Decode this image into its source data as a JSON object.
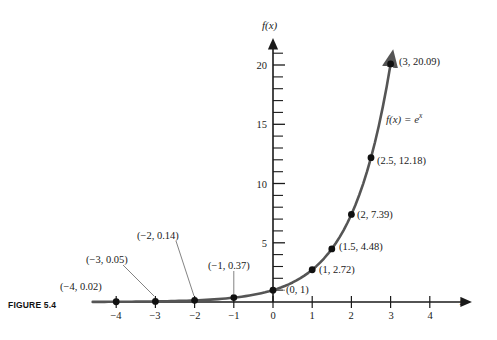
{
  "figure": {
    "caption": "FIGURE 5.4",
    "equation_label_fx": "f(x) = e",
    "equation_label_exp": "x"
  },
  "axes": {
    "x_axis_name": "x",
    "y_axis_name": "f(x)",
    "x_tick_labels": [
      "−4",
      "−3",
      "−2",
      "−1",
      "0",
      "1",
      "2",
      "3",
      "4"
    ],
    "y_tick_labels": [
      "5",
      "10",
      "15",
      "20"
    ]
  },
  "point_labels": [
    "(−4, 0.02)",
    "(−3, 0.05)",
    "(−2, 0.14)",
    "(−1, 0.37)",
    "(0, 1)",
    "(1, 2.72)",
    "(1.5, 4.48)",
    "(2, 7.39)",
    "(2.5, 12.18)",
    "(3, 20.09)"
  ],
  "colors": {
    "axis": "#1a1a1a",
    "curve": "#555555",
    "point": "#111111",
    "leader": "#6a6a6a",
    "text": "#1a1a1a"
  },
  "chart_data": {
    "type": "line",
    "title": "FIGURE 5.4",
    "subtitle": "",
    "function": "f(x) = e^x",
    "xlabel": "x",
    "ylabel": "f(x)",
    "xlim": [
      -4.6,
      4.9
    ],
    "ylim": [
      -0.9,
      21.6
    ],
    "x_ticks": [
      -4,
      -3,
      -2,
      -1,
      0,
      1,
      2,
      3,
      4
    ],
    "y_ticks": [
      5,
      10,
      15,
      20
    ],
    "y_minor_ticks": [
      1,
      2,
      3,
      4,
      6,
      7,
      8,
      9,
      11,
      12,
      13,
      14,
      16,
      17,
      18,
      19,
      21
    ],
    "grid": false,
    "legend": "none",
    "annotation": "f(x) = e^x",
    "series": [
      {
        "name": "f(x) = e^x",
        "x": [
          -4,
          -3,
          -2,
          -1,
          0,
          1,
          1.5,
          2,
          2.5,
          3
        ],
        "values": [
          0.02,
          0.05,
          0.14,
          0.37,
          1,
          2.72,
          4.48,
          7.39,
          12.18,
          20.09
        ],
        "labels": [
          "(−4, 0.02)",
          "(−3, 0.05)",
          "(−2, 0.14)",
          "(−1, 0.37)",
          "(0, 1)",
          "(1, 2.72)",
          "(1.5, 4.48)",
          "(2, 7.39)",
          "(2.5, 12.18)",
          "(3, 20.09)"
        ]
      }
    ]
  },
  "geometry": {
    "origin_x": 273,
    "origin_y": 302,
    "unit_x": 39.2,
    "unit_y": 11.85,
    "label_positions": [
      {
        "key": "n4",
        "text_x": 60,
        "text_y": 281,
        "anchor": "start",
        "leader": null
      },
      {
        "key": "n3",
        "text_x": 84,
        "text_y": 258,
        "anchor": "start",
        "leader": {
          "x1": 120,
          "y1": 265,
          "x2": 155,
          "y2": 296
        }
      },
      {
        "key": "n2",
        "text_x": 135,
        "text_y": 233,
        "anchor": "start",
        "leader": {
          "x1": 172,
          "y1": 240,
          "x2": 196,
          "y2": 296
        }
      },
      {
        "key": "n1",
        "text_x": 208,
        "text_y": 264,
        "anchor": "start",
        "leader": {
          "x1": 233,
          "y1": 271,
          "x2": 233,
          "y2": 294
        }
      },
      {
        "key": "p0",
        "text_x": 285,
        "text_y": 294,
        "anchor": "start",
        "leader": {
          "x1": 276,
          "y1": 290,
          "x2": 284,
          "y2": 290
        }
      },
      {
        "key": "p1",
        "text_x": 318,
        "text_y": 269,
        "anchor": "start",
        "leader": null
      },
      {
        "key": "p15",
        "text_x": 338,
        "text_y": 245,
        "anchor": "start",
        "leader": null
      },
      {
        "key": "p2",
        "text_x": 356,
        "text_y": 215,
        "anchor": "start",
        "leader": null
      },
      {
        "key": "p25",
        "text_x": 376,
        "text_y": 160,
        "anchor": "start",
        "leader": null
      },
      {
        "key": "p3",
        "text_x": 398,
        "text_y": 60,
        "anchor": "start",
        "leader": null
      }
    ]
  }
}
